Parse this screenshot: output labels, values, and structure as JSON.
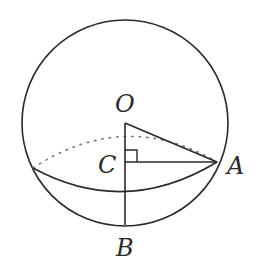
{
  "diagram": {
    "type": "sphere-cross-section",
    "labels": {
      "O": "O",
      "C": "C",
      "A": "A",
      "B": "B"
    },
    "elements": [
      "sphere outline",
      "circular cross-section (front solid, back dotted)",
      "segment OA",
      "segment OB through C",
      "segment CA",
      "right-angle mark at C"
    ],
    "colors": {
      "stroke": "#2a2a2a",
      "dotted": "#777777",
      "background": "#ffffff"
    }
  }
}
